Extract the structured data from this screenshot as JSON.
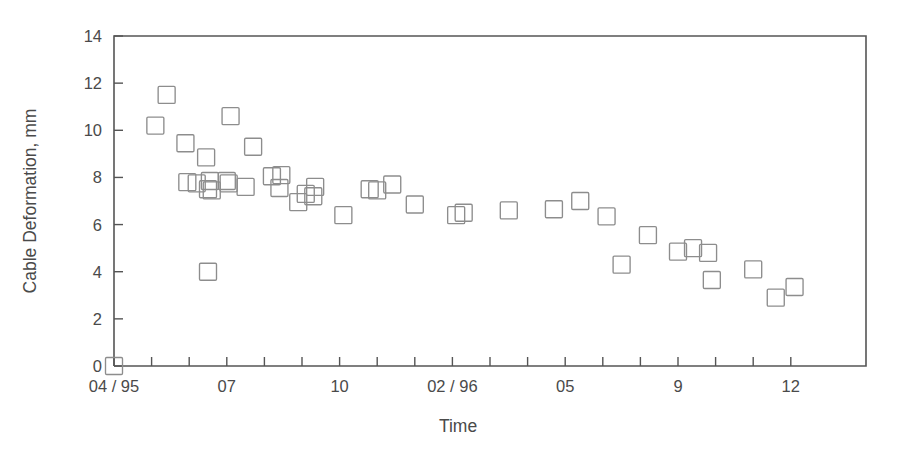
{
  "figure": {
    "background_color": "#ffffff",
    "ink_color": "#4a4a4a",
    "marker_color": "#8d8d8d"
  },
  "chart_data": {
    "type": "scatter",
    "title": "",
    "xlabel": "Time",
    "ylabel": "Cable Deformation, mm",
    "grid": false,
    "legend": "none",
    "marker": "open-square",
    "xlim": [
      0,
      20
    ],
    "ylim": [
      0,
      14
    ],
    "ytick_values": [
      0,
      2,
      4,
      6,
      8,
      10,
      12,
      14
    ],
    "ytick_labels": [
      "0",
      "2",
      "4",
      "6",
      "8",
      "10",
      "12",
      "14"
    ],
    "xtick_positions": [
      0,
      1,
      2,
      3,
      4,
      5,
      6,
      7,
      8,
      9,
      10,
      11,
      12,
      13,
      14,
      15,
      16,
      17,
      18
    ],
    "xtick_labeled_positions": [
      0,
      3,
      6,
      9,
      12,
      15,
      18
    ],
    "xtick_labels": [
      "04 / 95",
      "07",
      "10",
      "02 / 96",
      "05",
      "9",
      "12"
    ],
    "x_units": "months from 04/1995",
    "points": [
      {
        "x": 0.0,
        "y": 0.0
      },
      {
        "x": 1.1,
        "y": 10.2
      },
      {
        "x": 1.4,
        "y": 11.5
      },
      {
        "x": 1.9,
        "y": 9.45
      },
      {
        "x": 1.95,
        "y": 7.8
      },
      {
        "x": 2.2,
        "y": 7.75
      },
      {
        "x": 2.45,
        "y": 8.85
      },
      {
        "x": 2.5,
        "y": 7.5
      },
      {
        "x": 2.6,
        "y": 7.45
      },
      {
        "x": 2.55,
        "y": 7.85
      },
      {
        "x": 2.5,
        "y": 4.0
      },
      {
        "x": 3.0,
        "y": 7.85
      },
      {
        "x": 3.05,
        "y": 7.75
      },
      {
        "x": 3.1,
        "y": 10.6
      },
      {
        "x": 3.5,
        "y": 7.6
      },
      {
        "x": 3.7,
        "y": 9.3
      },
      {
        "x": 4.2,
        "y": 8.05
      },
      {
        "x": 4.45,
        "y": 8.1
      },
      {
        "x": 4.4,
        "y": 7.55
      },
      {
        "x": 4.9,
        "y": 6.95
      },
      {
        "x": 5.1,
        "y": 7.3
      },
      {
        "x": 5.35,
        "y": 7.6
      },
      {
        "x": 5.3,
        "y": 7.2
      },
      {
        "x": 6.1,
        "y": 6.4
      },
      {
        "x": 6.8,
        "y": 7.5
      },
      {
        "x": 7.0,
        "y": 7.45
      },
      {
        "x": 7.4,
        "y": 7.7
      },
      {
        "x": 8.0,
        "y": 6.85
      },
      {
        "x": 9.1,
        "y": 6.4
      },
      {
        "x": 9.3,
        "y": 6.5
      },
      {
        "x": 10.5,
        "y": 6.6
      },
      {
        "x": 11.7,
        "y": 6.65
      },
      {
        "x": 12.4,
        "y": 7.0
      },
      {
        "x": 13.1,
        "y": 6.35
      },
      {
        "x": 13.5,
        "y": 4.3
      },
      {
        "x": 14.2,
        "y": 5.55
      },
      {
        "x": 15.0,
        "y": 4.85
      },
      {
        "x": 15.4,
        "y": 5.0
      },
      {
        "x": 15.8,
        "y": 4.8
      },
      {
        "x": 15.9,
        "y": 3.65
      },
      {
        "x": 17.0,
        "y": 4.1
      },
      {
        "x": 17.6,
        "y": 2.9
      },
      {
        "x": 18.1,
        "y": 3.35
      }
    ]
  }
}
